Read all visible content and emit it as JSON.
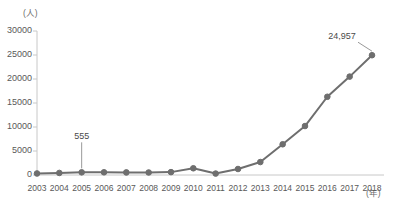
{
  "chart_data": {
    "type": "line",
    "title": "",
    "xlabel": "(年)",
    "ylabel": "(人)",
    "ylim": [
      0,
      30000
    ],
    "yticks": [
      0,
      5000,
      10000,
      15000,
      20000,
      25000,
      30000
    ],
    "ytick_labels": [
      "0",
      "5000",
      "10000",
      "15000",
      "20000",
      "25000",
      "30000"
    ],
    "grid": false,
    "legend": "none",
    "categories": [
      "2003",
      "2004",
      "2005",
      "2006",
      "2007",
      "2008",
      "2009",
      "2010",
      "2011",
      "2012",
      "2013",
      "2014",
      "2015",
      "2016",
      "2017",
      "2018"
    ],
    "values": [
      320,
      430,
      555,
      560,
      540,
      520,
      600,
      1400,
      300,
      1250,
      2700,
      6400,
      10200,
      16300,
      20500,
      24957
    ],
    "annotations": [
      {
        "label": "555",
        "category": "2005",
        "value": 555
      },
      {
        "label": "24,957",
        "category": "2018",
        "value": 24957
      }
    ],
    "series_color": "#6e6e6e",
    "marker_color": "#6e6e6e",
    "axis_color": "#c8c8c8",
    "tick_text_color": "#595959"
  }
}
